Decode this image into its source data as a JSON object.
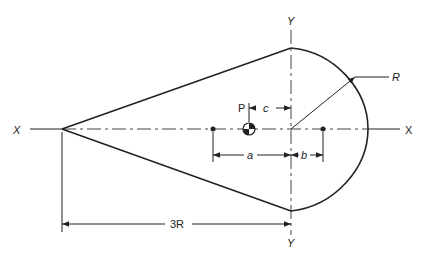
{
  "diagram": {
    "axis_labels": {
      "x_left": "X",
      "x_right": "X",
      "y_top": "Y",
      "y_bottom": "Y"
    },
    "point_label": "P",
    "dimensions": {
      "radius": "R",
      "length": "3R",
      "a": "a",
      "b": "b",
      "c": "c"
    },
    "colors": {
      "line": "#222222",
      "background": "#ffffff"
    }
  }
}
